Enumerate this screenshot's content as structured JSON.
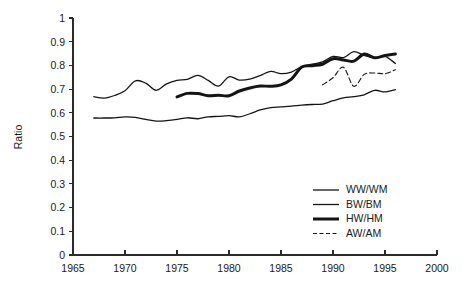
{
  "chart_data": {
    "type": "line",
    "title": "",
    "xlabel": "",
    "ylabel": "Ratio",
    "xlim": [
      1965,
      2000
    ],
    "ylim": [
      0,
      1
    ],
    "xticks": [
      1965,
      1970,
      1975,
      1980,
      1985,
      1990,
      1995,
      2000
    ],
    "yticks": [
      0,
      0.1,
      0.2,
      0.3,
      0.4,
      0.5,
      0.6,
      0.7,
      0.8,
      0.9,
      1
    ],
    "xtick_labels": [
      "1965",
      "1970",
      "1975",
      "1980",
      "1985",
      "1990",
      "1995",
      "2000"
    ],
    "ytick_labels": [
      "0",
      "0.1",
      "0.2",
      "0.3",
      "0.4",
      "0.5",
      "0.6",
      "0.7",
      "0.8",
      "0.9",
      "1"
    ],
    "grid": false,
    "legend_position": "lower-right",
    "series": [
      {
        "name": "WW/WM",
        "style": "solid",
        "width": 1.3,
        "color": "#141414",
        "x": [
          1967,
          1968,
          1969,
          1970,
          1971,
          1972,
          1973,
          1974,
          1975,
          1976,
          1977,
          1978,
          1979,
          1980,
          1981,
          1982,
          1983,
          1984,
          1985,
          1986,
          1987,
          1988,
          1989,
          1990,
          1991,
          1992,
          1993,
          1994,
          1995,
          1996
        ],
        "values": [
          0.578,
          0.578,
          0.579,
          0.583,
          0.581,
          0.572,
          0.565,
          0.567,
          0.572,
          0.579,
          0.575,
          0.583,
          0.585,
          0.588,
          0.583,
          0.596,
          0.612,
          0.622,
          0.625,
          0.628,
          0.632,
          0.635,
          0.637,
          0.651,
          0.663,
          0.668,
          0.676,
          0.695,
          0.688,
          0.698
        ]
      },
      {
        "name": "BW/BM",
        "style": "solid",
        "width": 1.3,
        "color": "#141414",
        "x": [
          1967,
          1968,
          1969,
          1970,
          1971,
          1972,
          1973,
          1974,
          1975,
          1976,
          1977,
          1978,
          1979,
          1980,
          1981,
          1982,
          1983,
          1984,
          1985,
          1986,
          1987,
          1988,
          1989,
          1990,
          1991,
          1992,
          1993,
          1994,
          1995,
          1996
        ],
        "values": [
          0.668,
          0.662,
          0.673,
          0.693,
          0.735,
          0.725,
          0.695,
          0.722,
          0.737,
          0.741,
          0.758,
          0.737,
          0.713,
          0.752,
          0.738,
          0.742,
          0.757,
          0.775,
          0.765,
          0.772,
          0.795,
          0.805,
          0.815,
          0.838,
          0.833,
          0.858,
          0.842,
          0.833,
          0.838,
          0.808
        ]
      },
      {
        "name": "HW/HM",
        "style": "solid",
        "width": 3.0,
        "color": "#141414",
        "x": [
          1975,
          1976,
          1977,
          1978,
          1979,
          1980,
          1981,
          1982,
          1983,
          1984,
          1985,
          1986,
          1987,
          1988,
          1989,
          1990,
          1991,
          1992,
          1993,
          1994,
          1995,
          1996
        ],
        "values": [
          0.667,
          0.682,
          0.681,
          0.672,
          0.674,
          0.672,
          0.692,
          0.705,
          0.713,
          0.712,
          0.718,
          0.742,
          0.793,
          0.799,
          0.805,
          0.828,
          0.823,
          0.818,
          0.848,
          0.832,
          0.842,
          0.848
        ]
      },
      {
        "name": "AW/AM",
        "style": "dashed",
        "width": 1.1,
        "color": "#3a3a3a",
        "x": [
          1989,
          1990,
          1991,
          1992,
          1993,
          1994,
          1995,
          1996
        ],
        "values": [
          0.718,
          0.748,
          0.792,
          0.712,
          0.762,
          0.768,
          0.765,
          0.782
        ]
      }
    ],
    "legend_entries": [
      "WW/WM",
      "BW/BM",
      "HW/HM",
      "AW/AM"
    ]
  },
  "axes": {
    "y_title": "Ratio"
  }
}
